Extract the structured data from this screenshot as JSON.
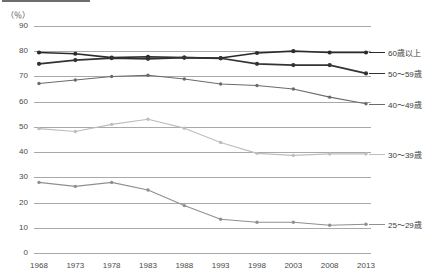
{
  "chart_data": {
    "type": "line",
    "title": "",
    "subtitle": "",
    "xlabel": "",
    "ylabel": "",
    "unit_label": "（％）",
    "x": [
      1968,
      1973,
      1978,
      1983,
      1988,
      1993,
      1998,
      2003,
      2008,
      2013
    ],
    "xtick_labels": [
      "1968",
      "1973",
      "1978",
      "1983",
      "1988",
      "1993",
      "1998",
      "2003",
      "2008",
      "2013"
    ],
    "ytick_labels": [
      "90",
      "80",
      "70",
      "60",
      "50",
      "40",
      "30",
      "20",
      "10",
      "0"
    ],
    "ytick_values": [
      90,
      80,
      70,
      60,
      50,
      40,
      30,
      20,
      10,
      0
    ],
    "ylim": [
      0,
      90
    ],
    "grid": true,
    "legend_position": "right-of-plot",
    "series": [
      {
        "name": "60歳以上",
        "color": "#2b2b2b",
        "values": [
          79.5,
          79.0,
          77.5,
          77.8,
          77.5,
          77.3,
          79.3,
          80.0,
          79.5,
          79.5
        ]
      },
      {
        "name": "50〜59歳",
        "color": "#333333",
        "values": [
          75.0,
          76.5,
          77.3,
          77.0,
          77.5,
          77.2,
          75.0,
          74.5,
          74.5,
          71.2
        ]
      },
      {
        "name": "40〜49歳",
        "color": "#6b6b6b",
        "values": [
          67.2,
          68.6,
          70.0,
          70.5,
          69.0,
          67.0,
          66.4,
          65.0,
          61.8,
          59.2
        ]
      },
      {
        "name": "30〜39歳",
        "color": "#bdbdbd",
        "values": [
          49.3,
          48.2,
          51.0,
          53.0,
          49.5,
          43.8,
          39.5,
          38.7,
          39.3,
          39.3
        ]
      },
      {
        "name": "25〜29歳",
        "color": "#8f8f8f",
        "values": [
          28.0,
          26.4,
          28.0,
          25.0,
          18.8,
          13.4,
          12.2,
          12.2,
          11.0,
          11.4
        ]
      }
    ]
  }
}
